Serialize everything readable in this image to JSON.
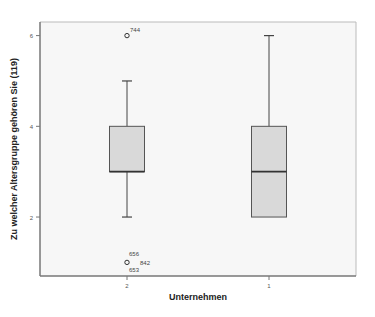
{
  "chart_data": {
    "type": "boxplot",
    "title": "",
    "xlabel": "Unternehmen",
    "ylabel": "Zu welcher Altersgruppe gehören Sie (119)",
    "categories": [
      "2",
      "1"
    ],
    "yticks": [
      2,
      4,
      6
    ],
    "ylim": [
      0.7,
      6.3
    ],
    "grid": false,
    "legend": null,
    "series": [
      {
        "name": "2",
        "whisker_low": 2,
        "q1": 3,
        "median": 3,
        "q3": 4,
        "whisker_high": 5,
        "outliers": [
          {
            "value": 6,
            "label": "744"
          },
          {
            "value": 1,
            "label": "656"
          },
          {
            "value": 1,
            "label": "842"
          },
          {
            "value": 1,
            "label": "653"
          }
        ]
      },
      {
        "name": "1",
        "whisker_low": 2,
        "q1": 2,
        "median": 3,
        "q3": 4,
        "whisker_high": 6,
        "outliers": []
      }
    ],
    "colors": {
      "box_fill": "#d9d9d9",
      "box_stroke": "#555555",
      "median": "#333333",
      "axis": "#777777",
      "plot_bg": "#f7f7f7"
    }
  }
}
